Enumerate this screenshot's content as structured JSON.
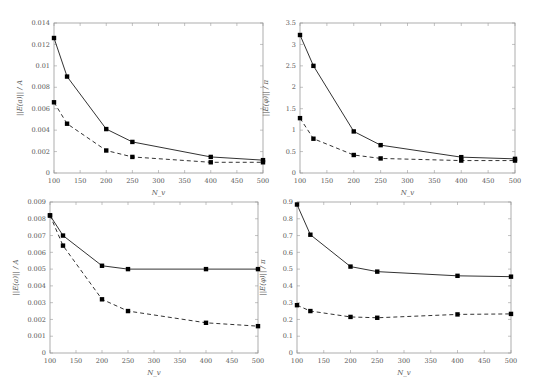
{
  "chart_data": [
    {
      "type": "line",
      "title": "",
      "xlabel": "N_v",
      "ylabel": "||E(a)|| / A",
      "x": [
        100,
        125,
        200,
        250,
        400,
        500
      ],
      "xlim": [
        100,
        500
      ],
      "ylim": [
        0,
        0.014
      ],
      "xticks": [
        "100",
        "150",
        "200",
        "250",
        "300",
        "350",
        "400",
        "450",
        "500"
      ],
      "yticks": [
        "0",
        "0.002",
        "0.004",
        "0.006",
        "0.008",
        "0.01",
        "0.012",
        "0.014"
      ],
      "grid": false,
      "series": [
        {
          "name": "solid",
          "style": "solid",
          "values": [
            0.0126,
            0.009,
            0.0041,
            0.0029,
            0.0015,
            0.0012
          ]
        },
        {
          "name": "dashed",
          "style": "dashed",
          "values": [
            0.0066,
            0.0046,
            0.0021,
            0.0015,
            0.001,
            0.001
          ]
        }
      ]
    },
    {
      "type": "line",
      "title": "",
      "xlabel": "N_v",
      "ylabel": "||E(φ)|| / π",
      "x": [
        100,
        125,
        200,
        250,
        400,
        500
      ],
      "xlim": [
        100,
        500
      ],
      "ylim": [
        0,
        3.5
      ],
      "xticks": [
        "100",
        "150",
        "200",
        "250",
        "300",
        "350",
        "400",
        "450",
        "500"
      ],
      "yticks": [
        "0",
        "0.5",
        "1",
        "1.5",
        "2",
        "2.5",
        "3",
        "3.5"
      ],
      "grid": false,
      "series": [
        {
          "name": "solid",
          "style": "solid",
          "values": [
            3.22,
            2.5,
            0.97,
            0.65,
            0.37,
            0.33
          ]
        },
        {
          "name": "dashed",
          "style": "dashed",
          "values": [
            1.28,
            0.8,
            0.42,
            0.34,
            0.29,
            0.29
          ]
        }
      ]
    },
    {
      "type": "line",
      "title": "",
      "xlabel": "N_v",
      "ylabel": "||E(a)|| / A",
      "x": [
        100,
        125,
        200,
        250,
        400,
        500
      ],
      "xlim": [
        100,
        500
      ],
      "ylim": [
        0,
        0.009
      ],
      "xticks": [
        "100",
        "150",
        "200",
        "250",
        "300",
        "350",
        "400",
        "450",
        "500"
      ],
      "yticks": [
        "0",
        "0.001",
        "0.002",
        "0.003",
        "0.004",
        "0.005",
        "0.006",
        "0.007",
        "0.008",
        "0.009"
      ],
      "grid": false,
      "series": [
        {
          "name": "solid",
          "style": "solid",
          "values": [
            0.0082,
            0.007,
            0.0052,
            0.005,
            0.005,
            0.005
          ]
        },
        {
          "name": "dashed",
          "style": "dashed",
          "values": [
            0.0082,
            0.0064,
            0.0032,
            0.0025,
            0.0018,
            0.0016
          ]
        }
      ]
    },
    {
      "type": "line",
      "title": "",
      "xlabel": "N_v",
      "ylabel": "||E(φ)|| / π",
      "x": [
        100,
        125,
        200,
        250,
        400,
        500
      ],
      "xlim": [
        100,
        500
      ],
      "ylim": [
        0,
        0.9
      ],
      "xticks": [
        "100",
        "150",
        "200",
        "250",
        "300",
        "350",
        "400",
        "450",
        "500"
      ],
      "yticks": [
        "0",
        "0.1",
        "0.2",
        "0.3",
        "0.4",
        "0.5",
        "0.6",
        "0.7",
        "0.8",
        "0.9"
      ],
      "grid": false,
      "series": [
        {
          "name": "solid",
          "style": "solid",
          "values": [
            0.885,
            0.705,
            0.515,
            0.485,
            0.46,
            0.455
          ]
        },
        {
          "name": "dashed",
          "style": "dashed",
          "values": [
            0.285,
            0.25,
            0.215,
            0.21,
            0.23,
            0.233
          ]
        }
      ]
    }
  ],
  "panels": [
    {
      "frame": {
        "left": 54,
        "top": 23,
        "right": 263,
        "bottom": 173
      }
    },
    {
      "frame": {
        "left": 300,
        "top": 23,
        "right": 515,
        "bottom": 173
      }
    },
    {
      "frame": {
        "left": 50,
        "top": 202,
        "right": 258,
        "bottom": 353
      }
    },
    {
      "frame": {
        "left": 297,
        "top": 202,
        "right": 511,
        "bottom": 353
      }
    }
  ]
}
